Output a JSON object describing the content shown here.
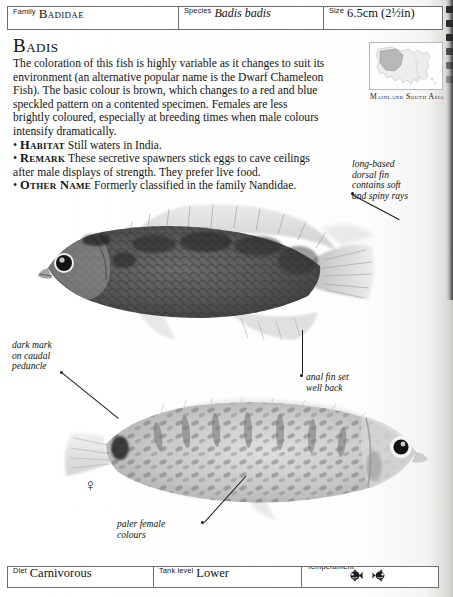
{
  "header": {
    "family_label": "Family",
    "family_value": "Badidae",
    "species_label": "Species",
    "species_value": "Badis badis",
    "size_label": "Size",
    "size_value": "6.5cm (2½in)"
  },
  "main": {
    "title": "Badis",
    "intro": "The coloration of this fish is highly variable as it changes to suit its environment (an alternative popular name is the Dwarf Chameleon Fish). The basic colour is brown, which changes to a red and blue speckled pattern on a contented specimen. Females are less brightly coloured, especially at breeding times when male colours intensify dramatically.",
    "facts": [
      {
        "keyword": "Habitat",
        "text": "Still waters in India."
      },
      {
        "keyword": "Remark",
        "text": "These secretive spawners stick eggs to cave ceilings after male displays of strength. They prefer live food."
      },
      {
        "keyword": "Other Name",
        "text": "Formerly classified in the family Nandidae."
      }
    ]
  },
  "map": {
    "region_label": "Mainland\nSouth Asia"
  },
  "annotations": [
    {
      "id": "dorsal-fin",
      "text": "long-based\ndorsal fin\ncontains soft\nand spiny rays"
    },
    {
      "id": "caudal-peduncle",
      "text": "dark mark\non caudal\npeduncle"
    },
    {
      "id": "anal-fin",
      "text": "anal fin set\nwell back"
    },
    {
      "id": "female-colours",
      "text": "paler female\ncolours"
    }
  ],
  "figures": {
    "male_fish_caption": "",
    "female_symbol": "♀"
  },
  "footer": {
    "diet_label": "Diet",
    "diet_value": "Carnivorous",
    "tank_level_label": "Tank level",
    "tank_level_value": "Lower",
    "temperament_label": "Temperament",
    "temperament_icons": [
      "fish-icon",
      "fish-icon"
    ]
  },
  "colors": {
    "paper": "#fdfdfb",
    "rule": "#6e6e6e",
    "ink": "#111111",
    "binding": "#2a2a2a"
  }
}
